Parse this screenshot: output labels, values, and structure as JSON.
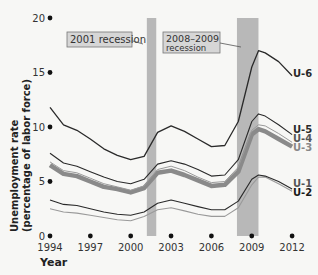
{
  "chart_data": {
    "type": "line",
    "title": "",
    "xlabel": "Year",
    "ylabel": "Unemployment rate (percentage of labor force)",
    "ylim": [
      0,
      20
    ],
    "xlim": [
      1994,
      2012
    ],
    "y_ticks": [
      "0",
      "5",
      "10",
      "15",
      "20"
    ],
    "x_ticks": [
      "1994",
      "1997",
      "2000",
      "2003",
      "2006",
      "2009",
      "2012"
    ],
    "grid": false,
    "legend_position": "inline-right",
    "annotations": [
      {
        "label": "2001 recession",
        "start": 2001.2,
        "end": 2001.9
      },
      {
        "label_line1": "2008–2009",
        "label_line2": "recession",
        "start": 2007.9,
        "end": 2009.5
      }
    ],
    "x": [
      1994,
      1995,
      1996,
      1997,
      1998,
      1999,
      2000,
      2001,
      2002,
      2003,
      2004,
      2005,
      2006,
      2007,
      2008,
      2009,
      2009.5,
      2010,
      2011,
      2012
    ],
    "series": [
      {
        "name": "U-6",
        "values": [
          11.8,
          10.2,
          9.7,
          8.9,
          8.0,
          7.4,
          7.0,
          7.3,
          9.5,
          10.1,
          9.6,
          8.9,
          8.2,
          8.3,
          10.5,
          15.5,
          17.0,
          16.8,
          16.0,
          14.7
        ]
      },
      {
        "name": "U-5",
        "values": [
          7.6,
          6.7,
          6.4,
          5.9,
          5.4,
          5.0,
          4.8,
          5.2,
          6.6,
          6.9,
          6.6,
          6.1,
          5.5,
          5.6,
          7.0,
          10.5,
          11.2,
          11.0,
          10.2,
          9.3
        ]
      },
      {
        "name": "U-4",
        "values": [
          6.8,
          6.0,
          5.8,
          5.3,
          4.8,
          4.5,
          4.2,
          4.6,
          6.1,
          6.4,
          6.0,
          5.4,
          4.9,
          5.0,
          6.3,
          9.7,
          10.2,
          10.1,
          9.4,
          8.6
        ]
      },
      {
        "name": "U-3",
        "values": [
          6.5,
          5.7,
          5.5,
          5.0,
          4.5,
          4.3,
          4.0,
          4.4,
          5.8,
          6.0,
          5.6,
          5.1,
          4.6,
          4.7,
          5.9,
          9.3,
          9.8,
          9.6,
          8.9,
          8.2
        ]
      },
      {
        "name": "U-1",
        "values": [
          3.3,
          2.9,
          2.8,
          2.5,
          2.2,
          2.0,
          1.9,
          2.2,
          3.0,
          3.3,
          3.0,
          2.7,
          2.4,
          2.4,
          3.2,
          5.2,
          5.6,
          5.5,
          5.0,
          4.3
        ]
      },
      {
        "name": "U-2",
        "values": [
          2.5,
          2.2,
          2.1,
          1.9,
          1.7,
          1.5,
          1.4,
          1.8,
          2.4,
          2.6,
          2.3,
          2.0,
          1.8,
          1.8,
          2.6,
          4.7,
          5.4,
          5.4,
          4.8,
          4.1
        ]
      }
    ]
  },
  "labels": {
    "y_axis": "Unemployment rate",
    "y_axis_sub": "(percentage of labor force)",
    "x_axis": "Year",
    "recession_2001": "2001 recession",
    "recession_2008_line1": "2008–2009",
    "recession_2008_line2": "recession",
    "u6": "U-6",
    "u5": "U-5",
    "u4": "U-4",
    "u3": "U-3",
    "u1": "U-1",
    "u2": "U-2"
  },
  "colors": {
    "shade": "#b8b8b8",
    "dark_line": "#2a2a2a",
    "thick_line": "#8a8a8a",
    "light_line": "#9a9a9a",
    "annotation_box": "#d6d6d6"
  }
}
